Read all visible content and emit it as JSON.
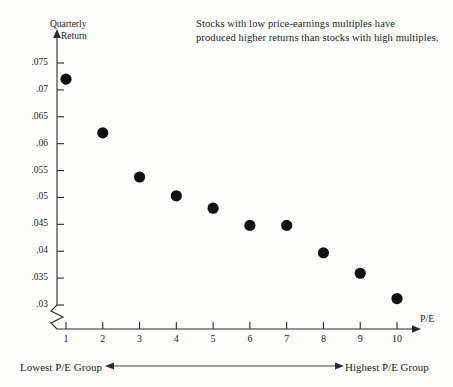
{
  "chart_data": {
    "type": "scatter",
    "title": "",
    "annotation": [
      "Stocks with low price-earnings multiples have",
      "produced higher returns than stocks with high multiples."
    ],
    "xlabel": "P/E",
    "ylabel_line1": "Quarterly",
    "ylabel_line2": "Return",
    "categories": [
      "1",
      "2",
      "3",
      "4",
      "5",
      "6",
      "7",
      "8",
      "9",
      "10"
    ],
    "x": [
      1,
      2,
      3,
      4,
      5,
      6,
      7,
      8,
      9,
      10
    ],
    "values": [
      0.072,
      0.062,
      0.0538,
      0.0503,
      0.048,
      0.0448,
      0.0448,
      0.0397,
      0.0359,
      0.0312
    ],
    "series": [
      {
        "name": "Quarterly Return by P/E Group",
        "values": [
          0.072,
          0.062,
          0.0538,
          0.0503,
          0.048,
          0.0448,
          0.0448,
          0.0397,
          0.0359,
          0.0312
        ]
      }
    ],
    "ytick_labels": [
      ".075",
      ".07",
      ".065",
      ".06",
      ".055",
      ".05",
      ".045",
      ".04",
      ".035",
      ".03"
    ],
    "ytick_values": [
      0.075,
      0.07,
      0.065,
      0.06,
      0.055,
      0.05,
      0.045,
      0.04,
      0.035,
      0.03
    ],
    "ylim": [
      0.03,
      0.075
    ],
    "xlim": [
      1,
      10
    ],
    "grid": false,
    "legend": "none",
    "axis_break": true,
    "marker_color": "#111111",
    "axis_color": "#2a2a2a",
    "background_color": "#fdfdfb"
  },
  "footer": {
    "left_label": "Lowest P/E Group",
    "right_label": "Highest P/E Group"
  }
}
